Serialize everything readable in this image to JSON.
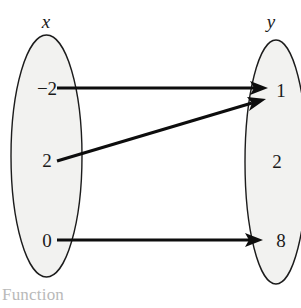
{
  "diagram": {
    "caption": "Function",
    "domain_set": {
      "label": "x",
      "elements": [
        {
          "value": "−2"
        },
        {
          "value": "2"
        },
        {
          "value": "0"
        }
      ]
    },
    "range_set": {
      "label": "y",
      "elements": [
        {
          "value": "1"
        },
        {
          "value": "2"
        },
        {
          "value": "8"
        }
      ]
    },
    "mappings": [
      {
        "from": "−2",
        "to": "1"
      },
      {
        "from": "2",
        "to": "1"
      },
      {
        "from": "0",
        "to": "8"
      }
    ],
    "colors": {
      "oval_fill": "#f2f2f0",
      "oval_stroke": "#1c1c1c",
      "arrow": "#0d0d0d",
      "text": "#1a1a1a",
      "caption": "#b9b9b9",
      "background": "#ffffff"
    }
  }
}
